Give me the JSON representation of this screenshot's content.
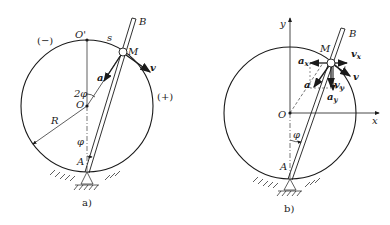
{
  "figure_a": {
    "caption": "a)",
    "labels": {
      "minus": "(−)",
      "plus": "(+)",
      "O_prime": "O'",
      "s": "s",
      "M": "M",
      "B": "B",
      "v": "v",
      "a": "a",
      "two_phi": "2φ",
      "O": "O",
      "R": "R",
      "phi": "φ",
      "A": "A"
    }
  },
  "figure_b": {
    "caption": "b)",
    "labels": {
      "y": "y",
      "x": "x",
      "B": "B",
      "M": "M",
      "a_x": "a",
      "a_x_sub": "x",
      "v_x": "v",
      "v_x_sub": "x",
      "v": "v",
      "a": "a",
      "v_y": "v",
      "v_y_sub": "y",
      "a_y": "a",
      "a_y_sub": "y",
      "O": "O",
      "phi": "φ",
      "A": "A"
    }
  }
}
